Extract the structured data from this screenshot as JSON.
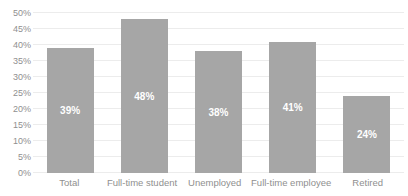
{
  "chart_data": {
    "type": "bar",
    "title": "",
    "categories": [
      "Total",
      "Full-time student",
      "Unemployed",
      "Full-time employee",
      "Retired"
    ],
    "values": [
      39,
      48,
      38,
      41,
      24
    ],
    "value_labels": [
      "39%",
      "48%",
      "38%",
      "41%",
      "24%"
    ],
    "xlabel": "",
    "ylabel": "",
    "ylim": [
      0,
      50
    ],
    "ytick_step": 5,
    "ytick_labels": [
      "0%",
      "5%",
      "10%",
      "15%",
      "20%",
      "25%",
      "30%",
      "35%",
      "40%",
      "45%",
      "50%"
    ],
    "grid": "horizontal",
    "legend": "none",
    "colors": {
      "bar": "#a6a6a6",
      "bar_label": "#ffffff",
      "axis_text": "#8f8f8f",
      "gridline": "#ececec",
      "background": "#ffffff"
    }
  }
}
